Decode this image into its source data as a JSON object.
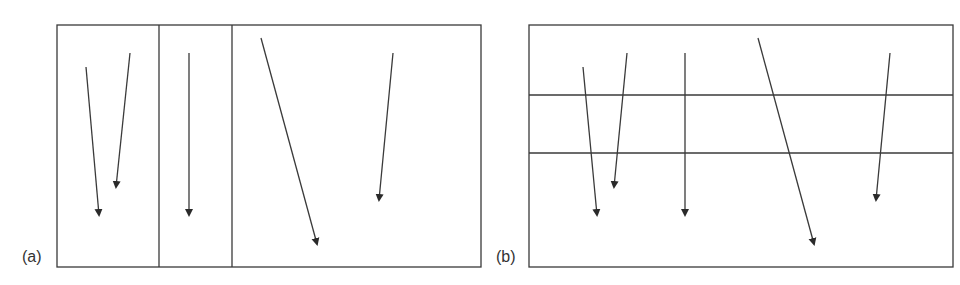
{
  "figure": {
    "panels": [
      {
        "label": "(a)",
        "partition": "vertical",
        "box": {
          "x": 57,
          "y": 25,
          "w": 424,
          "h": 242
        },
        "dividers": [
          159,
          232
        ],
        "arrows": [
          {
            "x1": 86,
            "y1": 67,
            "x2": 99,
            "y2": 215
          },
          {
            "x1": 130,
            "y1": 53,
            "x2": 116,
            "y2": 187
          },
          {
            "x1": 189,
            "y1": 53,
            "x2": 189,
            "y2": 215
          },
          {
            "x1": 261,
            "y1": 38,
            "x2": 317,
            "y2": 244
          },
          {
            "x1": 393,
            "y1": 53,
            "x2": 379,
            "y2": 200
          }
        ]
      },
      {
        "label": "(b)",
        "partition": "horizontal",
        "box": {
          "x": 529,
          "y": 25,
          "w": 424,
          "h": 242
        },
        "dividers": [
          95,
          153
        ],
        "arrows": [
          {
            "x1": 583,
            "y1": 67,
            "x2": 597,
            "y2": 215
          },
          {
            "x1": 627,
            "y1": 53,
            "x2": 614,
            "y2": 187
          },
          {
            "x1": 685,
            "y1": 53,
            "x2": 685,
            "y2": 215
          },
          {
            "x1": 758,
            "y1": 38,
            "x2": 814,
            "y2": 244
          },
          {
            "x1": 890,
            "y1": 53,
            "x2": 876,
            "y2": 200
          }
        ]
      }
    ],
    "colors": {
      "line": "#3a3a3a",
      "text": "#333333"
    }
  }
}
